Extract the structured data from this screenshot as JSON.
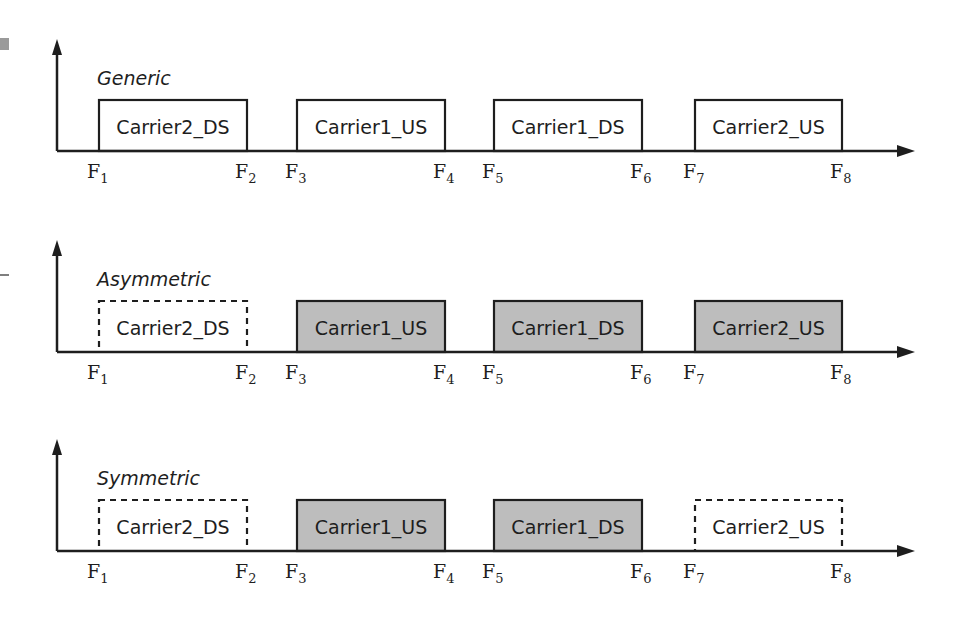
{
  "colors": {
    "ink": "#1e1e1e",
    "filled": "#bdbdbd",
    "empty": "#ffffff"
  },
  "frequency_labels": [
    "F1",
    "F2",
    "F3",
    "F4",
    "F5",
    "F6",
    "F7",
    "F8"
  ],
  "panels": [
    {
      "title": "Generic",
      "carriers": [
        {
          "label": "Carrier2_DS",
          "from": 1,
          "to": 2,
          "style": "solid",
          "fill": "empty"
        },
        {
          "label": "Carrier1_US",
          "from": 3,
          "to": 4,
          "style": "solid",
          "fill": "empty"
        },
        {
          "label": "Carrier1_DS",
          "from": 5,
          "to": 6,
          "style": "solid",
          "fill": "empty"
        },
        {
          "label": "Carrier2_US",
          "from": 7,
          "to": 8,
          "style": "solid",
          "fill": "empty"
        }
      ]
    },
    {
      "title": "Asymmetric",
      "carriers": [
        {
          "label": "Carrier2_DS",
          "from": 1,
          "to": 2,
          "style": "dashed",
          "fill": "empty"
        },
        {
          "label": "Carrier1_US",
          "from": 3,
          "to": 4,
          "style": "solid",
          "fill": "filled"
        },
        {
          "label": "Carrier1_DS",
          "from": 5,
          "to": 6,
          "style": "solid",
          "fill": "filled"
        },
        {
          "label": "Carrier2_US",
          "from": 7,
          "to": 8,
          "style": "solid",
          "fill": "filled"
        }
      ]
    },
    {
      "title": "Symmetric",
      "carriers": [
        {
          "label": "Carrier2_DS",
          "from": 1,
          "to": 2,
          "style": "dashed",
          "fill": "empty"
        },
        {
          "label": "Carrier1_US",
          "from": 3,
          "to": 4,
          "style": "solid",
          "fill": "filled"
        },
        {
          "label": "Carrier1_DS",
          "from": 5,
          "to": 6,
          "style": "solid",
          "fill": "filled"
        },
        {
          "label": "Carrier2_US",
          "from": 7,
          "to": 8,
          "style": "dashed",
          "fill": "empty"
        }
      ]
    }
  ]
}
